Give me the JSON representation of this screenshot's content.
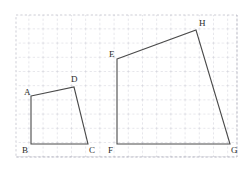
{
  "canvas": {
    "width": 251,
    "height": 169,
    "background": "#ffffff"
  },
  "grid": {
    "name": "dashed-square-grid",
    "color": "#b9b9c4",
    "spacing_px": 14.2,
    "style": "dashed",
    "x_start": 16,
    "y_start": 15,
    "x_end": 237,
    "y_end": 157,
    "columns": 16,
    "rows": 10
  },
  "figures": [
    {
      "name": "quadrilateral-abcd",
      "label": "ABCD",
      "stroke": "#4a4a4a",
      "closed": true,
      "vertices": [
        {
          "id": "A",
          "x": 31,
          "y": 96,
          "label": "A",
          "label_x": 24,
          "label_y": 95
        },
        {
          "id": "D",
          "x": 74,
          "y": 87,
          "label": "D",
          "label_x": 71,
          "label_y": 82
        },
        {
          "id": "C",
          "x": 88,
          "y": 144,
          "label": "C",
          "label_x": 89,
          "label_y": 153
        },
        {
          "id": "B",
          "x": 31,
          "y": 144,
          "label": "B",
          "label_x": 22,
          "label_y": 153
        }
      ],
      "edges": [
        "A-D",
        "D-C",
        "C-B",
        "B-A"
      ]
    },
    {
      "name": "quadrilateral-efgh",
      "label": "EFGH",
      "stroke": "#4a4a4a",
      "closed": true,
      "vertices": [
        {
          "id": "E",
          "x": 117,
          "y": 59,
          "label": "E",
          "label_x": 109,
          "label_y": 57
        },
        {
          "id": "H",
          "x": 196,
          "y": 30,
          "label": "H",
          "label_x": 199,
          "label_y": 26
        },
        {
          "id": "G",
          "x": 230,
          "y": 144,
          "label": "G",
          "label_x": 231,
          "label_y": 153
        },
        {
          "id": "F",
          "x": 117,
          "y": 144,
          "label": "F",
          "label_x": 108,
          "label_y": 153
        }
      ],
      "edges": [
        "E-H",
        "H-G",
        "G-F",
        "F-E"
      ]
    }
  ],
  "labels": {
    "A": "A",
    "B": "B",
    "C": "C",
    "D": "D",
    "E": "E",
    "F": "F",
    "G": "G",
    "H": "H"
  }
}
